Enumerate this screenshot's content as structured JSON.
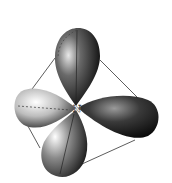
{
  "diagram": {
    "type": "sp3 hybrid orbitals",
    "central_atom_label": "N",
    "lobes": [
      {
        "name": "top-lobe",
        "direction": "up"
      },
      {
        "name": "left-lobe",
        "direction": "left"
      },
      {
        "name": "right-lobe",
        "direction": "right"
      },
      {
        "name": "bottom-lobe",
        "direction": "down-left"
      }
    ],
    "outline": "tetrahedron",
    "colors": {
      "background": "#ffffff",
      "lobe_dark": "#111111",
      "lobe_light": "#f2f2f2",
      "edge": "#333333"
    }
  }
}
